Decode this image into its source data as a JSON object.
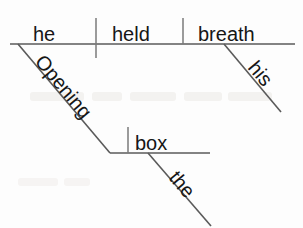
{
  "diagram": {
    "type": "sentence-diagram",
    "style": "reed-kellogg",
    "sentence": "Opening his box, he held the breath",
    "background_color": "#fdfdfd",
    "line_color": "#5a5a5a",
    "text_color": "#161616",
    "canvas": {
      "width": 303,
      "height": 228
    },
    "baselines": [
      {
        "id": "main-baseline",
        "x1": 10,
        "y1": 44,
        "x2": 295,
        "y2": 44
      },
      {
        "id": "participial-baseline",
        "x1": 110,
        "y1": 153,
        "x2": 210,
        "y2": 153
      }
    ],
    "dividers": [
      {
        "id": "subject-verb-divider",
        "x": 96,
        "y1": 18,
        "y2": 58
      },
      {
        "id": "verb-object-divider",
        "x": 183,
        "y1": 18,
        "y2": 44
      },
      {
        "id": "box-modifier-divider",
        "x": 128,
        "y1": 127,
        "y2": 153
      }
    ],
    "slants": [
      {
        "id": "participle-slant",
        "x1": 18,
        "y1": 44,
        "x2": 110,
        "y2": 153
      },
      {
        "id": "his-slant",
        "x1": 224,
        "y1": 44,
        "x2": 281,
        "y2": 112
      },
      {
        "id": "the-slant",
        "x1": 148,
        "y1": 153,
        "x2": 211,
        "y2": 226
      }
    ],
    "words": [
      {
        "id": "word-he",
        "text": "he",
        "role": "subject",
        "x": 33,
        "y": 41,
        "rotation": 0,
        "anchor": "start"
      },
      {
        "id": "word-held",
        "text": "held",
        "role": "verb",
        "x": 112,
        "y": 41,
        "rotation": 0,
        "anchor": "start"
      },
      {
        "id": "word-breath",
        "text": "breath",
        "role": "direct-object",
        "x": 198,
        "y": 41,
        "rotation": 0,
        "anchor": "start"
      },
      {
        "id": "word-opening",
        "text": "Opening",
        "role": "participle",
        "x": 34,
        "y": 62,
        "rotation": 50,
        "anchor": "start"
      },
      {
        "id": "word-his",
        "text": "his",
        "role": "possessive-modifier",
        "x": 247,
        "y": 68,
        "rotation": 50,
        "anchor": "start"
      },
      {
        "id": "word-box",
        "text": "box",
        "role": "participle-object",
        "x": 135,
        "y": 150,
        "rotation": 0,
        "anchor": "start"
      },
      {
        "id": "word-the",
        "text": "the",
        "role": "article-modifier",
        "x": 168,
        "y": 178,
        "rotation": 50,
        "anchor": "start"
      }
    ],
    "watermark": {
      "visible": true,
      "line1": "",
      "line2": ""
    }
  }
}
